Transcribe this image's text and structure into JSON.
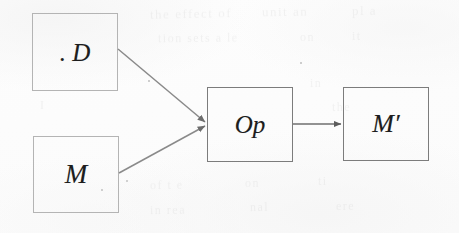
{
  "figure": {
    "type": "flow-diagram",
    "medium": "scanned-page",
    "background_color": "#fdfdfd",
    "ink_color": "#1d1d1d"
  },
  "nodes": [
    {
      "id": "d",
      "label": ". D",
      "name": "node-d",
      "stroke": "#b4b4b4",
      "x": 32,
      "y": 13,
      "width": 86,
      "height": 78
    },
    {
      "id": "m",
      "label": "M",
      "name": "node-m",
      "stroke": "#b4b4b4",
      "x": 33,
      "y": 136,
      "width": 86,
      "height": 77
    },
    {
      "id": "op",
      "label": "Op",
      "name": "node-op",
      "stroke": "#7c7c7c",
      "x": 207,
      "y": 87,
      "width": 86,
      "height": 75
    },
    {
      "id": "mp",
      "label": "M′",
      "name": "node-mprime",
      "stroke": "#7c7c7c",
      "x": 343,
      "y": 87,
      "width": 86,
      "height": 74
    }
  ],
  "edges": [
    {
      "id": "d-to-op",
      "from": "d",
      "to": "op",
      "label": "",
      "x1": 118,
      "y1": 49,
      "x2": 205,
      "y2": 122,
      "stroke": "#8a8a8a"
    },
    {
      "id": "m-to-op",
      "from": "m",
      "to": "op",
      "label": "",
      "x1": 119,
      "y1": 173,
      "x2": 205,
      "y2": 126,
      "stroke": "#8a8a8a"
    },
    {
      "id": "op-to-mprime",
      "from": "op",
      "to": "mp",
      "label": "",
      "x1": 293,
      "y1": 124,
      "x2": 341,
      "y2": 124,
      "stroke": "#6f6f6f"
    }
  ],
  "ghost_text": [
    {
      "text": "the effect of",
      "x": 150,
      "y": 6,
      "size": 13,
      "rotate": -1.2
    },
    {
      "text": "unit an",
      "x": 262,
      "y": 4,
      "size": 13,
      "rotate": -0.8
    },
    {
      "text": "pl a",
      "x": 352,
      "y": 3,
      "size": 13,
      "rotate": -1.0
    },
    {
      "text": "tion sets  a  le",
      "x": 158,
      "y": 31,
      "size": 12,
      "rotate": -0.6
    },
    {
      "text": "on",
      "x": 300,
      "y": 30,
      "size": 12,
      "rotate": -0.6
    },
    {
      "text": "it",
      "x": 352,
      "y": 29,
      "size": 12,
      "rotate": -0.6
    },
    {
      "text": "in",
      "x": 310,
      "y": 76,
      "size": 12,
      "rotate": -0.5
    },
    {
      "text": "the",
      "x": 332,
      "y": 100,
      "size": 12,
      "rotate": -0.4
    },
    {
      "text": "of  t e",
      "x": 150,
      "y": 178,
      "size": 12,
      "rotate": -0.9
    },
    {
      "text": "on",
      "x": 245,
      "y": 176,
      "size": 12,
      "rotate": -0.7
    },
    {
      "text": "ti",
      "x": 318,
      "y": 174,
      "size": 12,
      "rotate": -0.7
    },
    {
      "text": "in  rea",
      "x": 150,
      "y": 203,
      "size": 12,
      "rotate": -0.8
    },
    {
      "text": "nal",
      "x": 250,
      "y": 200,
      "size": 12,
      "rotate": -0.8
    },
    {
      "text": "ere",
      "x": 336,
      "y": 199,
      "size": 12,
      "rotate": -0.8
    },
    {
      "text": "I",
      "x": 40,
      "y": 98,
      "size": 12,
      "rotate": 0
    }
  ],
  "specks": [
    {
      "x": 126,
      "y": 180,
      "size": 2.2
    },
    {
      "x": 101,
      "y": 189,
      "size": 1.8
    },
    {
      "x": 148,
      "y": 80,
      "size": 1.6
    },
    {
      "x": 300,
      "y": 62,
      "size": 1.5
    }
  ]
}
